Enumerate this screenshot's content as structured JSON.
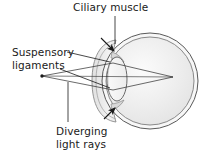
{
  "figure": {
    "background_color": "#ffffff",
    "ink_color": "#1a1a1a"
  },
  "labels": {
    "ciliary_muscle": "Ciliary muscle",
    "suspensory_line1": "Suspensory",
    "suspensory_line2": "ligaments",
    "diverging_line1": "Diverging",
    "diverging_line2": "light rays"
  },
  "diagram": {
    "eyeball": {
      "center_x": 150,
      "center_y": 81,
      "outer_radius": 48,
      "inner_radius": 44,
      "fill": "#eeeeee",
      "stroke": "#5a5a5a"
    },
    "cornea": {
      "description": "anterior bulge at left of eyeball",
      "fill": "#e4e4e4",
      "stroke": "#7a7a7a"
    },
    "lens": {
      "center_x": 117,
      "center_y": 79,
      "radius_x": 10,
      "radius_y": 22,
      "fill": "#f4f4f4",
      "stroke": "#6a6a6a"
    },
    "light_source": {
      "x": 42,
      "y": 76,
      "radius": 1.6
    },
    "focal_point": {
      "x": 173,
      "y": 77
    },
    "rays": [
      {
        "name": "upper-ray",
        "x1": 42,
        "y1": 76,
        "x2": 173,
        "y2": 77
      },
      {
        "name": "lower-ray",
        "x1": 42,
        "y1": 76,
        "x2": 173,
        "y2": 77
      }
    ],
    "arrows": [
      {
        "name": "ciliary-upper-arrow",
        "x": 112,
        "y": 50,
        "angle_deg": 45
      },
      {
        "name": "ciliary-lower-arrow",
        "x": 112,
        "y": 110,
        "angle_deg": -45
      }
    ],
    "leaders": [
      {
        "name": "ciliary-muscle-leader",
        "x1": 115,
        "y1": 16,
        "x2": 115,
        "y2": 45
      },
      {
        "name": "suspensory-upper-leader",
        "x1": 66,
        "y1": 52,
        "x2": 112,
        "y2": 65
      },
      {
        "name": "suspensory-lower-leader",
        "x1": 62,
        "y1": 68,
        "x2": 112,
        "y2": 88
      },
      {
        "name": "diverging-rays-leader",
        "x1": 68,
        "y1": 82,
        "x2": 68,
        "y2": 122
      }
    ]
  }
}
